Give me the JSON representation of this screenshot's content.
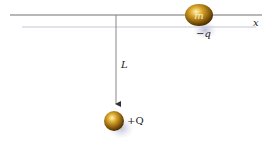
{
  "diagram": {
    "axis_label": "x",
    "length_label": "L",
    "moving_mass_label": "m",
    "moving_charge_label": "−q",
    "fixed_charge_label": "+Q",
    "colors": {
      "axis_line": "#9a9a9a",
      "shadow_line": "#e4e4ee",
      "ball_highlight": "#fff3a0",
      "ball_mid": "#c8961e",
      "ball_dark": "#5a3a05",
      "shadow": "#b8b8d0"
    }
  }
}
